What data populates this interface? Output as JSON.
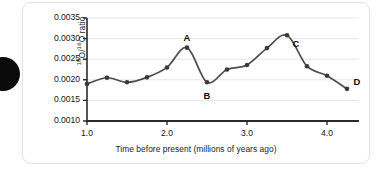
{
  "figure": {
    "card_present": true,
    "bullet_marker": "black-circle"
  },
  "chart_data": {
    "type": "line",
    "title": "",
    "xlabel": "Time before present (millions of years ago)",
    "ylabel": "18O/16O ratio",
    "ylabel_parts": {
      "sup1": "18",
      "base1": "O/",
      "sup2": "16",
      "base2": "O ratio"
    },
    "xlim": [
      1.0,
      4.4
    ],
    "ylim": [
      0.001,
      0.0035
    ],
    "grid": "horizontal",
    "legend": "none",
    "line_color": "#4d4d4d",
    "marker_color": "#3a3a3a",
    "xticks": [
      1.0,
      2.0,
      3.0,
      4.0
    ],
    "xtick_labels": [
      "1.0",
      "2.0",
      "3.0",
      "4.0"
    ],
    "yticks": [
      0.001,
      0.0015,
      0.002,
      0.0025,
      0.003,
      0.0035
    ],
    "ytick_labels": [
      "0.0010",
      "0.0015",
      "0.0020",
      "0.0025",
      "0.0030",
      "0.0035"
    ],
    "x": [
      1.0,
      1.25,
      1.5,
      1.75,
      2.0,
      2.25,
      2.5,
      2.75,
      3.0,
      3.25,
      3.5,
      3.75,
      4.0,
      4.25
    ],
    "values": [
      0.0019,
      0.00205,
      0.00194,
      0.00206,
      0.0023,
      0.00278,
      0.00194,
      0.00225,
      0.00236,
      0.00277,
      0.00308,
      0.00233,
      0.0021,
      0.00178
    ],
    "annotations": [
      {
        "label": "A",
        "x": 2.25,
        "y": 0.00278,
        "position": "above"
      },
      {
        "label": "B",
        "x": 2.5,
        "y": 0.00194,
        "position": "below"
      },
      {
        "label": "C",
        "x": 3.5,
        "y": 0.00308,
        "position": "below-right"
      },
      {
        "label": "D",
        "x": 4.25,
        "y": 0.00178,
        "position": "above-right"
      }
    ]
  }
}
